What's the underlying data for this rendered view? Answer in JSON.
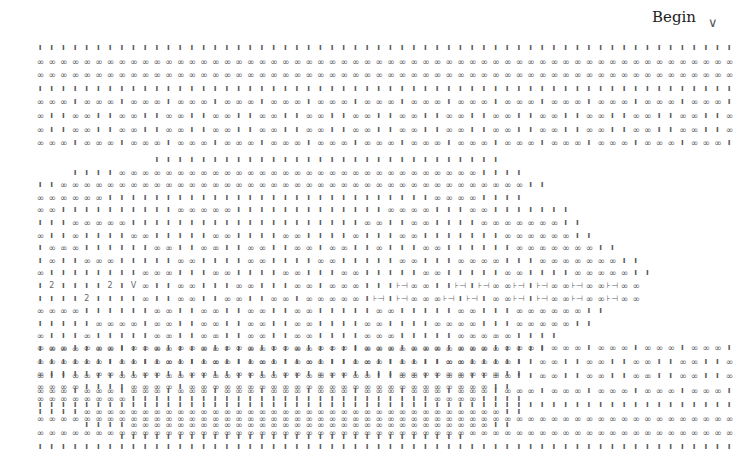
{
  "header": {
    "title": "Begin",
    "begin_marker": "∨"
  },
  "legend_symbols": {
    "I": "knit",
    "O": "purl (∞)",
    "2": "2",
    "V": "V",
    "H": "⊣⊢ twist"
  },
  "grid": {
    "x0": 40,
    "dx": 11.68,
    "y0": 48,
    "dy": 14.0,
    "cols": 60,
    "rows": [
      "IIIIIIIIIIIIIIIIIIIIIIIIIIIIIIIIIIIIIIIIIIIIIIIIIIIIIIIIIIII",
      "OOOOOOOOOOOOOOOOOOOOOOOOOOOOOOOOOOOOOOOOOOOOOOOOOOOOOOOOOOOO",
      "OOOOOOOOOOOOOOOOOOOOOOOOOOOOOOOOOOOOOOOOOOOOOOOOOOOOOOOOOOOO",
      "IIIIIIIIIIIIIIIIIIIIIIIIIIIIIIIIIIIIIIIIIIIIIIIIIIIIIIIIIIII",
      "OOOIOOOIOOOIOOOIOOOIOOOIOOOIOOOIOOOIOOOIOOOIOOOIOOOIOOOIOOOI",
      "OIIOOIIOOIIOOIIOOIIOOIIOOIIOOIIOOIIOOIIOOIIOOIIOOIIOOIIOOIIO",
      "OIIOOIIOOIIOOIIOOIIOOIIOOIIOOIIOOIIOOIIOOIIOOIIOOIIOOIIOOIIO",
      "OOOIOOOIOOOIOOOIOOOIOOOIOOOIOOOIOOOIOOOIOOOIOOOIOOOIOOOIOOOI",
      "..........IIIIIIIIIIIIIIIIIIIIIIIIIIIIII....................",
      "...IIIIOOOOOOOOOOOOOOOOOOOOOOOOOOOOOOOIIII..................",
      "IIOOOOOOOOOOOOOOOOOOOOOOOOOOOOOOOOOOOOOOOOII................",
      "OOOOOOIIIIIIIIIIIIIIIIIIIIIIIIIIIIOOOOIIII..................",
      "OOIIIIIIIIIIOOOOOIIIIIIIIIIIIIOOOOIIIOOIIIIIII..............",
      "IIIOOOOOIIIIIIIIIIIIIIIIIIIIOOIIOOIIIIOOOOOOOII.............",
      "OIIOIIIIOOIIIIIOOIIIIOOIIIIOIIIOOIIIIIIIOOOOOOII............",
      "IOOOIIIIIIOOIIOOIIOOIIOOIOOIIOIIIOOIIIIIIOOOOOOOII..........",
      "IOIIOOOIIIIIOOIIIIOOIIIIOOIIIIIOOIIIOOOOIIIOOOOOOOII........",
      "OIIIIIIIIOOOIIIOOIIIIOOIIIOOIIIIIOOIIIIIOOIIIIOOOOOII.......",
      "I2IIII2IVOIIOOIIIOOIIIOOIOOOIIIHOOIIHIHOOHIHOOHOOHOO.......",
      "IIII2IIIIOIIOOIIOOIIOOIOOOOOIHIHOOOHIHIOOHIHOOHOOHOO.......",
      "OOOOIIIIIIOOIIOOIIOOIIOOIIIIIOOIIIIIOOIIIOOOOOOII..........",
      "IIIIIOOOOIOOIIOOIIOOIIOOIIIIOOIIIIOOOOIIIOOOOOII...........",
      "OIIIOIIIIIOOIIOOIIOOIIOOIIIIOOOIIIIIOOOOOIIII..............",
      "IOOOIOOIIIOOIIOOIIOOIIOOIIIIOOOOOOOOOOOOIIII...............",
      "IOOIIOIIIIOOIIOOIIOOIIOOIIIIOOIIIIIOOOOIII.................",
      "OIIIIOOIIOOIIOOIIOOIIOOIOOOIIIIOOOOOOOOOII.................",
      "OOOOIIIIOOOOIOOOOOOOOOOOOOOOOOOOOOOOOOOII..................",
      "OOOOOOOOIIIIIIIIIIIIIIIIIIIIIIIIIIOOOOIIII.................",
      "IIIIOOOOOOOOOOOOOOOOOOOOOOOOOOOOOOOOOOOOII.................",
      "....IIIIOOOOOOOOOOOOOOOOOOOOOOOOOOOOOOOII..................",
      ".......IIIIIIIIIIIIIIIIIIIIIIIIIIIIII.......................",
      "OOOIOOOIOOOIOOOIOOOIOOOIOOOIOOOIOOOIOOOIOOOIOOOIOOOIOOOIOOOI",
      "OIIOOIIOOIIOOIIOOIIOOIIOOIIOOIIOOIIOOIIOOIIOOIIOOIIOOIIOOIIO",
      "OIIOOIIOOIIOOIIOOIIOOIIOOIIOOIIOOIIOOIIOOIIOOIIOOIIOOIIOOIIO",
      "OOOIOOOIOOOIOOOIOOOIOOOIOOOIOOOIOOOIOOOIOOOIOOOIOOOIOOOIOOOI",
      "IIIIIIIIIIIIIIIIIIIIIIIIIIIIIIIIIIIIIIIIIIIIIIIIIIIIIIIIIIII",
      "OOOOOOOOOOOOOOOOOOOOOOOOOOOOOOOOOOOOOOOOOOOOOOOOOOOOOOOOOOOO",
      "OOOOOOOOOOOOOOOOOOOOOOOOOOOOOOOOOOOOOOOOOOOOOOOOOOOOOOOOOOOO",
      "IIIIIIIIIIIIIIIIIIIIIIIIIIIIIIIIIIIIIIIIIIIIIIIIIIIIIIIIIIII"
    ],
    "row_y": [
      48,
      61,
      75,
      89,
      103,
      117,
      131,
      145,
      159,
      171,
      184,
      197,
      211,
      225,
      239,
      253,
      267,
      281,
      295,
      309,
      323,
      337,
      351,
      365,
      379,
      393,
      407,
      421,
      435,
      449,
      461,
      297,
      311,
      325,
      339,
      353,
      367,
      381,
      395
    ],
    "glyphs": {
      "I": "ı",
      "O": "∞",
      "2": "2",
      "V": "V",
      "H": "⊦⊣"
    }
  }
}
